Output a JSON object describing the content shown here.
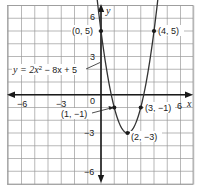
{
  "chart_data": {
    "type": "line",
    "title": "",
    "xlabel": "x",
    "ylabel": "y",
    "xlim": [
      -7,
      7
    ],
    "ylim": [
      -7,
      7
    ],
    "grid": true,
    "x_ticks": [
      {
        "value": -6,
        "label": "−6"
      },
      {
        "value": -3,
        "label": "−3"
      },
      {
        "value": 0,
        "label": "0"
      },
      {
        "value": 6,
        "label": "6"
      }
    ],
    "y_ticks": [
      {
        "value": 6,
        "label": "6"
      },
      {
        "value": 3,
        "label": "3"
      },
      {
        "value": -3,
        "label": "−3"
      },
      {
        "value": -6,
        "label": "−6"
      }
    ],
    "series": [
      {
        "name": "y = 2x² − 8x + 5",
        "equation": {
          "a": 2,
          "b": -8,
          "c": 5
        },
        "x_range": [
          -0.4,
          4.4
        ],
        "points": [
          {
            "x": 0,
            "y": 5,
            "label": "(0, 5)"
          },
          {
            "x": 1,
            "y": -1,
            "label": "(1, −1)"
          },
          {
            "x": 2,
            "y": -3,
            "label": "(2, −3)"
          },
          {
            "x": 3,
            "y": -1,
            "label": "(3, −1)"
          },
          {
            "x": 4,
            "y": 5,
            "label": "(4, 5)"
          }
        ]
      }
    ],
    "annotations": [
      {
        "text": "y = 2x² − 8x + 5",
        "points_to": {
          "x": 0.05,
          "y": 2.5
        }
      }
    ]
  },
  "labels": {
    "x_axis": "x",
    "y_axis": "y",
    "equation_prefix": "y = 2x",
    "equation_sup": "2",
    "equation_suffix": " − 8x + 5",
    "p0": "(0, 5)",
    "p1": "(1, −1)",
    "p2": "(2, −3)",
    "p3": "(3, −1)",
    "p4": "(4, 5)",
    "xt_m6": "−6",
    "xt_m3": "−3",
    "xt_0": "0",
    "xt_6": "6",
    "yt_6": "6",
    "yt_3": "3",
    "yt_m3": "−3",
    "yt_m6": "−6"
  },
  "colors": {
    "grid": "#9a9a9a",
    "axis": "#1a1a1a",
    "curve": "#333333"
  }
}
